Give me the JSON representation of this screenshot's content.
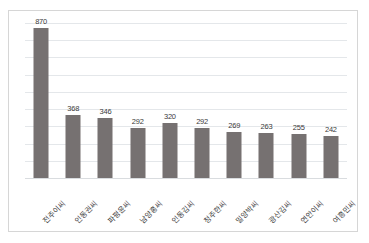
{
  "chart_data": {
    "type": "bar",
    "title": "",
    "subtitle": "",
    "xlabel": "",
    "ylabel": "",
    "categories": [
      "전주이씨",
      "인동권씨",
      "파평윤씨",
      "남양홍씨",
      "인동김씨",
      "청주한씨",
      "밀양박씨",
      "광산김씨",
      "연안이씨",
      "여흥민씨"
    ],
    "values": [
      870,
      368,
      346,
      292,
      320,
      292,
      269,
      263,
      255,
      242
    ],
    "value_labels": [
      "870",
      "368",
      "346",
      "292",
      "320",
      "292",
      "269",
      "263",
      "255",
      "242"
    ],
    "ylim": [
      0,
      900
    ],
    "y_tick_labels": [],
    "grid": true,
    "gridline_count": 9,
    "legend": false,
    "legend_position": "none",
    "bar_color": "#767171",
    "gridline_color": "#e4e7ea",
    "frame_color": "#d6d6d6",
    "label_color": "#3b3b3b",
    "label_rotation_deg": -45,
    "background_color": "#ffffff"
  }
}
